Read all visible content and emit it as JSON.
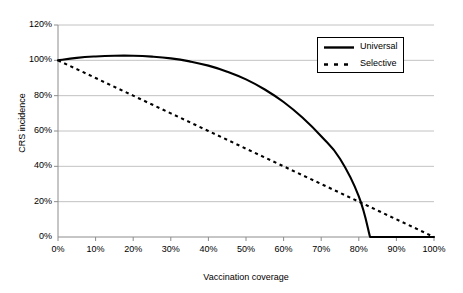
{
  "chart_data": {
    "type": "line",
    "title": "",
    "xlabel": "Vaccination coverage",
    "ylabel": "CRS incidence",
    "xlim": [
      0,
      100
    ],
    "ylim": [
      0,
      120
    ],
    "grid": true,
    "legend_position": "top-right",
    "xticks": [
      "0%",
      "10%",
      "20%",
      "30%",
      "40%",
      "50%",
      "60%",
      "70%",
      "80%",
      "90%",
      "100%"
    ],
    "xtick_values": [
      0,
      10,
      20,
      30,
      40,
      50,
      60,
      70,
      80,
      90,
      100
    ],
    "yticks": [
      "0%",
      "20%",
      "40%",
      "60%",
      "80%",
      "100%",
      "120%"
    ],
    "ytick_values": [
      0,
      20,
      40,
      60,
      80,
      100,
      120
    ],
    "series": [
      {
        "name": "Universal",
        "style": "solid",
        "color": "#000000",
        "x": [
          0,
          5,
          10,
          15,
          20,
          25,
          30,
          35,
          40,
          45,
          50,
          55,
          60,
          65,
          70,
          75,
          80,
          83,
          85,
          90,
          95,
          100
        ],
        "values": [
          100,
          101.4,
          102.2,
          102.6,
          102.6,
          102.1,
          101.1,
          99.4,
          97.0,
          93.6,
          89.2,
          83.5,
          76.4,
          67.6,
          57.0,
          44.3,
          23.0,
          0,
          0,
          0,
          0,
          0
        ]
      },
      {
        "name": "Selective",
        "style": "dashed",
        "color": "#000000",
        "x": [
          0,
          10,
          20,
          30,
          40,
          50,
          60,
          70,
          80,
          90,
          100
        ],
        "values": [
          100,
          90,
          80,
          70,
          60,
          50,
          40,
          30,
          20,
          10,
          0
        ]
      }
    ],
    "annotations": [
      {
        "name": "crossing-point",
        "x": 76,
        "y": 22
      }
    ]
  },
  "legend": {
    "items": [
      {
        "label": "Universal",
        "style": "solid"
      },
      {
        "label": "Selective",
        "style": "dashed"
      }
    ]
  },
  "colors": {
    "line": "#000000",
    "grid": "#b3b3b3",
    "axis": "#808080",
    "background": "#ffffff"
  }
}
